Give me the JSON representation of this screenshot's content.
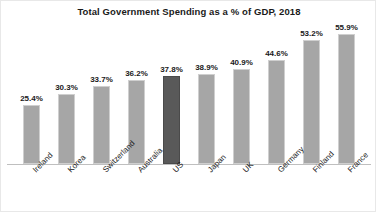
{
  "chart_data": {
    "type": "bar",
    "title": "Total Government Spending as a % of GDP, 2018",
    "xlabel": "",
    "ylabel": "",
    "ylim": [
      0,
      60
    ],
    "grid": false,
    "legend": "none",
    "categories": [
      "Ireland",
      "Korea",
      "Switzerland",
      "Australia",
      "US",
      "Japan",
      "UK",
      "Germany",
      "Finland",
      "France"
    ],
    "values": [
      25.4,
      30.3,
      33.7,
      36.2,
      37.8,
      38.9,
      40.9,
      44.6,
      53.2,
      55.9
    ],
    "value_labels": [
      "25.4%",
      "30.3%",
      "33.7%",
      "36.2%",
      "37.8%",
      "38.9%",
      "40.9%",
      "44.6%",
      "53.2%",
      "55.9%"
    ],
    "highlight_index": 4,
    "colors": {
      "bar": "#a6a6a6",
      "bar_outline": "#cfcfcf",
      "highlight_bar": "#595959",
      "axis": "#bfbfbf",
      "text": "#1a1a1a",
      "background": "#ffffff"
    }
  }
}
